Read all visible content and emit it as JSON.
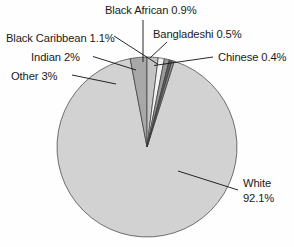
{
  "chart_data": {
    "type": "pie",
    "title": "",
    "subtitle": "",
    "xlabel": "",
    "ylabel": "",
    "legend_position": "none",
    "grid": false,
    "units": "percent",
    "start_angle_deg": 0,
    "direction": "clockwise",
    "categories": [
      "White",
      "Chinese",
      "Bangladeshi",
      "Black African",
      "Black Caribbean",
      "Indian",
      "Other"
    ],
    "values": [
      92.1,
      0.4,
      0.5,
      0.9,
      1.1,
      2.0,
      3.0
    ],
    "slices": [
      {
        "name": "White",
        "value": 92.1,
        "value_text": "92.1%",
        "label_line1": "White",
        "label_line2": "92.1%",
        "label_full": "White 92.1%",
        "color": "#d2d2d2"
      },
      {
        "name": "Chinese",
        "value": 0.4,
        "value_text": "0.4%",
        "label_full": "Chinese 0.4%",
        "color": "#8f8f8f"
      },
      {
        "name": "Bangladeshi",
        "value": 0.5,
        "value_text": "0.5%",
        "label_full": "Bangladeshi 0.5%",
        "color": "#5c5c5c"
      },
      {
        "name": "Black African",
        "value": 0.9,
        "value_text": "0.9%",
        "label_full": "Black African 0.9%",
        "color": "#9a9a9a"
      },
      {
        "name": "Black Caribbean",
        "value": 1.1,
        "value_text": "1.1%",
        "label_full": "Black Caribbean 1.1%",
        "color": "#f4f4f4"
      },
      {
        "name": "Indian",
        "value": 2.0,
        "value_text": "2%",
        "label_full": "Indian 2%",
        "color": "#c4c4c4"
      },
      {
        "name": "Other",
        "value": 3.0,
        "value_text": "3%",
        "label_full": "Other 3%",
        "color": "#a8a8a8"
      }
    ]
  },
  "labels": {
    "black_african": "Black African 0.9%",
    "black_caribbean": "Black Caribbean 1.1%",
    "bangladeshi": "Bangladeshi 0.5%",
    "chinese": "Chinese 0.4%",
    "indian": "Indian 2%",
    "other": "Other 3%",
    "white_name": "White",
    "white_value": "92.1%"
  },
  "colors": {
    "background": "#fefefe",
    "text": "#1a1a1a",
    "outline": "#3a3a3a",
    "leader": "#111111"
  }
}
